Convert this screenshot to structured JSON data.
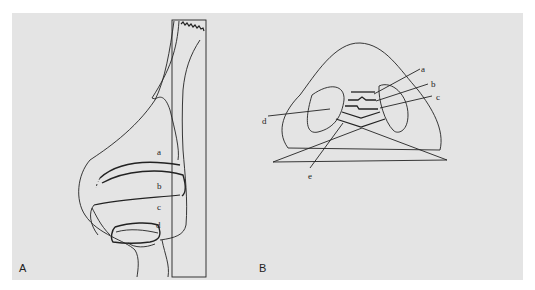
{
  "figure": {
    "background": "#e4e4e4",
    "stroke": "#222222",
    "panels": [
      {
        "id": "A",
        "label": "A",
        "view": "lateral",
        "labels": [
          "a",
          "b",
          "c",
          "d"
        ]
      },
      {
        "id": "B",
        "label": "B",
        "view": "basal",
        "labels": [
          "a",
          "b",
          "c",
          "d",
          "e"
        ]
      }
    ]
  }
}
